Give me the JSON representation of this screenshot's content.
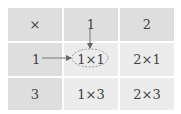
{
  "table": {
    "rows": [
      [
        "×",
        "1",
        "2"
      ],
      [
        "1",
        "1×1",
        "2×1"
      ],
      [
        "3",
        "1×3",
        "2×3"
      ]
    ]
  },
  "annotations": {
    "highlighted_cell": "1×1",
    "arrows": [
      "from column header 1 down to 1×1",
      "from row header 1 right to 1×1"
    ]
  },
  "colors": {
    "header_bg": "#dedede",
    "cell_bg": "#ececec",
    "text": "#444444",
    "arrow": "#666666"
  }
}
